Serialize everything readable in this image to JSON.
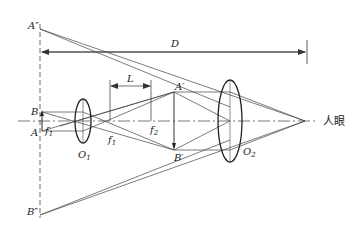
{
  "diagram": {
    "type": "optical ray diagram (two-lens system / telescope-microscope imaging)",
    "colors": {
      "line": "#333333",
      "lens": "#222222",
      "background": "#ffffff"
    },
    "labels": {
      "A_double_prime": "A″",
      "B_double_prime": "B″",
      "A_prime": "A′",
      "B_prime": "B′",
      "A": "A",
      "B": "B",
      "D": "D",
      "L": "L",
      "f1_left": "f",
      "f1_left_sub": "1",
      "f1_right": "f",
      "f1_right_sub": "1",
      "f2": "f",
      "f2_sub": "2",
      "O1": "O",
      "O1_sub": "1",
      "O2": "O",
      "O2_sub": "2",
      "eye": "人眼"
    },
    "elements": {
      "optical_axis": "dash-dot horizontal line",
      "virtual_image_plane": "dashed vertical line through A″ and B″",
      "lens_O1": "objective lens (small ellipse)",
      "lens_O2": "eyepiece lens (large ellipse)",
      "dimension_D": "distance from image plane to eye",
      "dimension_L": "distance between f1 and f2"
    }
  }
}
